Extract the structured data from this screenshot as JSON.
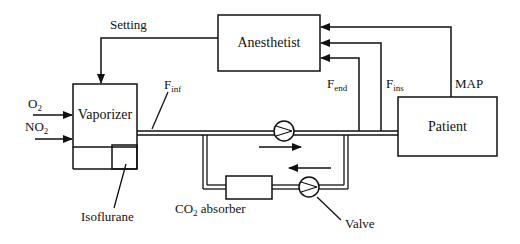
{
  "diagram": {
    "blocks": {
      "anesthetist": "Anesthetist",
      "vaporizer": "Vaporizer",
      "patient": "Patient",
      "co2_absorber": {
        "main": "CO",
        "sub": "2",
        "rest": " absorber"
      }
    },
    "labels": {
      "setting": "Setting",
      "o2": {
        "main": "O",
        "sub": "2"
      },
      "no2": {
        "main": "NO",
        "sub": "2"
      },
      "f_inf": {
        "main": "F",
        "sub": "inf"
      },
      "f_end": {
        "main": "F",
        "sub": "end"
      },
      "f_ins": {
        "main": "F",
        "sub": "ins"
      },
      "map": "MAP",
      "isoflurane": "Isoflurane",
      "valve": "Valve"
    },
    "colors": {
      "stroke": "#111111",
      "background": "#ffffff"
    }
  }
}
